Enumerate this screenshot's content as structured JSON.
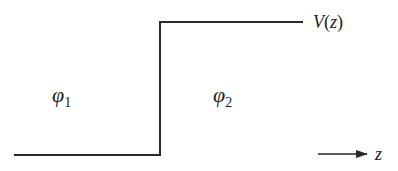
{
  "diagram": {
    "type": "step-potential",
    "colors": {
      "line": "#2a2a2a",
      "text": "#222222",
      "background": "#ffffff"
    },
    "potential_label": "V(z)",
    "region_left": {
      "symbol": "φ",
      "subscript": "1"
    },
    "region_right": {
      "symbol": "φ",
      "subscript": "2"
    },
    "axis": {
      "label": "z",
      "direction": "right"
    },
    "geometry": {
      "low_level_y": 155,
      "high_level_y": 22,
      "step_x": 160,
      "low_start_x": 14,
      "high_end_x": 303
    }
  }
}
